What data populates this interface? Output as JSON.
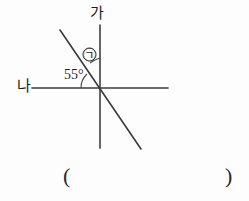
{
  "figure": {
    "type": "geometry-angle-diagram",
    "background_color": "#fdfdfd",
    "stroke_color": "#3a3a3a",
    "text_color": "#1d1d1d",
    "labels": {
      "vertical_line_label": "가",
      "horizontal_line_label": "나",
      "known_angle": "55°",
      "unknown_angle_marker": "㉠"
    },
    "lines": {
      "vertical": {
        "name": "가",
        "x1": 100,
        "y1": 25,
        "x2": 100,
        "y2": 148
      },
      "horizontal": {
        "name": "나",
        "x1": 32,
        "y1": 88,
        "x2": 168,
        "y2": 88
      },
      "diagonal": {
        "x1": 60,
        "y1": 30,
        "x2": 141,
        "y2": 149
      }
    },
    "intersection": {
      "x": 100,
      "y": 88
    },
    "answer_blank": {
      "open_paren": "(",
      "close_paren": ")"
    }
  }
}
